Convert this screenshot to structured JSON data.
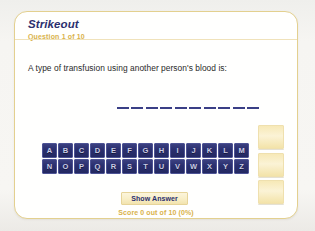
{
  "card": {
    "title": "Strikeout",
    "question_counter": "Question 1 of 10",
    "question_text": "A type of transfusion using another person's blood is:",
    "answer_blanks": {
      "count": 10,
      "revealed_letters": [
        "",
        "",
        "",
        "",
        "",
        "",
        "",
        "",
        "",
        ""
      ]
    },
    "strike_strips": {
      "count": 3,
      "labels": [
        "strike-strip-1",
        "strike-strip-2",
        "strike-strip-3"
      ]
    },
    "keyboard": {
      "row1": [
        "A",
        "B",
        "C",
        "D",
        "E",
        "F",
        "G",
        "H",
        "I",
        "J",
        "K",
        "L",
        "M"
      ],
      "row2": [
        "N",
        "O",
        "P",
        "Q",
        "R",
        "S",
        "T",
        "U",
        "V",
        "W",
        "X",
        "Y",
        "Z"
      ]
    },
    "show_answer_label": "Show Answer",
    "score_text": "Score 0 out of 10 (0%)"
  },
  "colors": {
    "accent_gold": "#d9b24a",
    "card_border": "#e3d08f",
    "navy": "#2b2f6e",
    "key_face": "#2b3070",
    "strip_cream": "#f7e9b7",
    "page_background": "#f3f3f1"
  }
}
